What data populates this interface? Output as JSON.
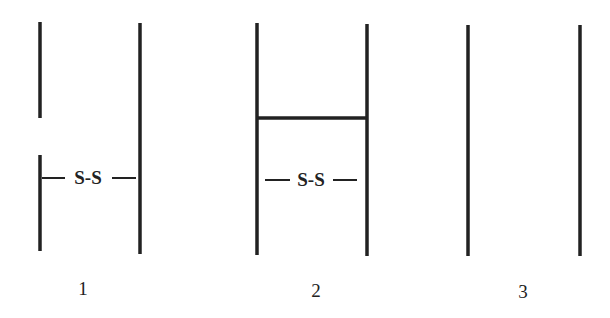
{
  "diagram": {
    "panels": [
      {
        "label": "1",
        "annotation": "S-S",
        "description": "Left line broken with gap; S-S bond between lines below gap"
      },
      {
        "label": "2",
        "annotation": "S-S",
        "description": "Two vertical lines joined by horizontal bar; S-S bond below bar"
      },
      {
        "label": "3",
        "description": "Two separate vertical lines"
      }
    ],
    "colors": {
      "stroke": "#222222",
      "background": "#ffffff"
    }
  }
}
